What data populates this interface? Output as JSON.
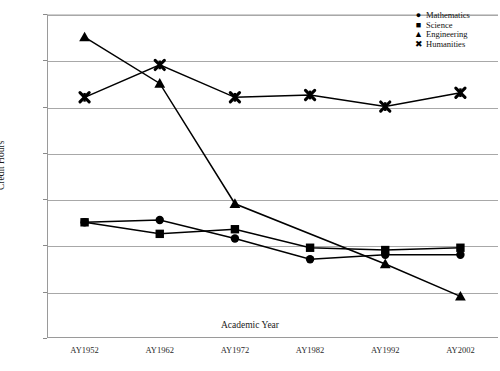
{
  "chart_data": {
    "type": "line",
    "title": "",
    "xlabel": "Academic Year",
    "ylabel": "Credit Hours",
    "categories": [
      "AY1952",
      "AY1962",
      "AY1972",
      "AY1982",
      "AY1992",
      "AY2002"
    ],
    "ylim": [
      0,
      70
    ],
    "yticks": [
      0,
      10,
      20,
      30,
      40,
      50,
      60,
      70
    ],
    "grid": true,
    "legend_position": "top-right-inside",
    "series": [
      {
        "name": "Mathematics",
        "marker": "circle",
        "symbol": "●",
        "color": "#000000",
        "values": [
          25,
          25.5,
          21.5,
          17,
          18,
          18
        ]
      },
      {
        "name": "Science",
        "marker": "square",
        "symbol": "■",
        "color": "#000000",
        "values": [
          25,
          22.5,
          23.5,
          19.5,
          19,
          19.5
        ]
      },
      {
        "name": "Engineering",
        "marker": "triangle",
        "symbol": "▲",
        "color": "#000000",
        "values": [
          65,
          55,
          29,
          null,
          16,
          9
        ]
      },
      {
        "name": "Humanities",
        "marker": "x",
        "symbol": "✖",
        "color": "#000000",
        "values": [
          52,
          59,
          52,
          52.5,
          50,
          53
        ]
      }
    ]
  }
}
